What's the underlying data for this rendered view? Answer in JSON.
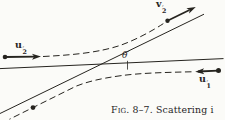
{
  "figure": {
    "type": "two-particle scattering diagram",
    "ink_color": "#26241f",
    "paper_color": "#fbfbf8",
    "vectors": {
      "u2_prime": {
        "base": "u",
        "sub": "2",
        "prime": "′"
      },
      "v2_prime": {
        "base": "v",
        "sub": "2",
        "prime": "′"
      },
      "u1_prime": {
        "base": "u",
        "sub": "1",
        "prime": "′"
      }
    },
    "angle": {
      "base": "θ",
      "prime": "′"
    },
    "caption": {
      "fig_number": "Fig. 8–7.",
      "text": "Scattering i"
    }
  }
}
